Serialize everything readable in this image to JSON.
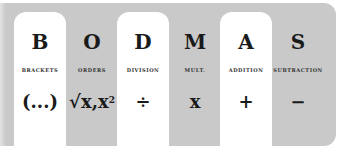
{
  "colors": {
    "panel": "#c9c9c9",
    "highlight": "#ffffff",
    "text": "#1a1a1a"
  },
  "columns": [
    {
      "letter": "B",
      "label": "BRACKETS",
      "symbol": "(...)",
      "highlight": true
    },
    {
      "letter": "O",
      "label": "ORDERS",
      "symbol": "√x,x",
      "symbol_sup": "2",
      "highlight": false
    },
    {
      "letter": "D",
      "label": "DIVISION",
      "symbol": "÷",
      "highlight": true
    },
    {
      "letter": "M",
      "label": "MULT.",
      "symbol": "x",
      "highlight": false
    },
    {
      "letter": "A",
      "label": "ADDITION",
      "symbol": "+",
      "highlight": true
    },
    {
      "letter": "S",
      "label": "SUBTRACTION",
      "symbol": "−",
      "highlight": false
    }
  ]
}
